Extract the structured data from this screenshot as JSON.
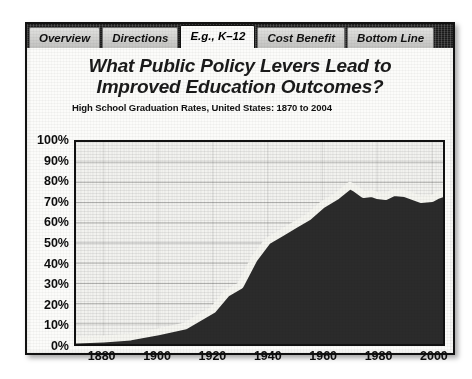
{
  "slide": {
    "tabs": [
      {
        "label": "Overview",
        "active": false
      },
      {
        "label": "Directions",
        "active": false
      },
      {
        "label": "E.g., K–12",
        "active": true
      },
      {
        "label": "Cost Benefit",
        "active": false
      },
      {
        "label": "Bottom Line",
        "active": false
      }
    ],
    "title_line1": "What Public Policy Levers Lead to",
    "title_line2": "Improved Education Outcomes?"
  },
  "colors": {
    "area_fill": "#2b2b2b",
    "line": "#f5f5f0",
    "axis": "#111111",
    "plot_bg": "#f2f2ef",
    "tab_inactive": "#c9c9c7",
    "tab_active": "#fbfbfa",
    "tab_band": "#1b1b1b"
  },
  "chart_data": {
    "type": "area",
    "title": "High School Graduation Rates, United States: 1870 to 2004",
    "xlabel": "",
    "ylabel": "",
    "xlim": [
      1870,
      2004
    ],
    "ylim": [
      0,
      100
    ],
    "grid": true,
    "legend": "none",
    "yticks": [
      "100%",
      "90%",
      "80%",
      "70%",
      "60%",
      "50%",
      "40%",
      "30%",
      "20%",
      "10%",
      "0%"
    ],
    "ytick_values": [
      100,
      90,
      80,
      70,
      60,
      50,
      40,
      30,
      20,
      10,
      0
    ],
    "xticks": [
      "1880",
      "1900",
      "1920",
      "1940",
      "1960",
      "1980",
      "2000"
    ],
    "xtick_values": [
      1880,
      1900,
      1920,
      1940,
      1960,
      1980,
      2000
    ],
    "x": [
      1870,
      1880,
      1890,
      1900,
      1910,
      1920,
      1925,
      1930,
      1935,
      1940,
      1945,
      1950,
      1955,
      1960,
      1965,
      1970,
      1972,
      1975,
      1978,
      1980,
      1983,
      1986,
      1990,
      1993,
      1996,
      2000,
      2002,
      2004
    ],
    "values": [
      2,
      2.5,
      3.5,
      6,
      9,
      17,
      25,
      29,
      42,
      51,
      55,
      59,
      63,
      69,
      73,
      78.5,
      77,
      74,
      74.5,
      73.5,
      73,
      75,
      74.5,
      73,
      71.5,
      72,
      73.5,
      74.5
    ],
    "series": [
      {
        "name": "High school graduation rate",
        "values": [
          2,
          2.5,
          3.5,
          6,
          9,
          17,
          25,
          29,
          42,
          51,
          55,
          59,
          63,
          69,
          73,
          78.5,
          77,
          74,
          74.5,
          73.5,
          73,
          75,
          74.5,
          73,
          71.5,
          72,
          73.5,
          74.5
        ]
      }
    ]
  }
}
